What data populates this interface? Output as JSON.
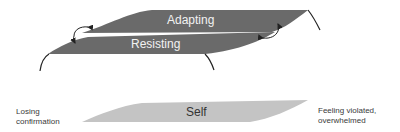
{
  "diagram": {
    "bands": {
      "adapting": {
        "label": "Adapting",
        "color": "#6a6a6a"
      },
      "resisting": {
        "label": "Resisting",
        "color": "#6a6a6a"
      },
      "self": {
        "label": "Self",
        "color": "#c4c4c4"
      }
    },
    "side_labels": {
      "left": [
        "Losing",
        "confirmation"
      ],
      "right": [
        "Feeling violated,",
        "overwhelmed"
      ]
    },
    "arrows": [
      {
        "from": "adapting",
        "to": "resisting",
        "side": "left"
      },
      {
        "from": "resisting",
        "to": "adapting",
        "side": "right"
      }
    ]
  }
}
